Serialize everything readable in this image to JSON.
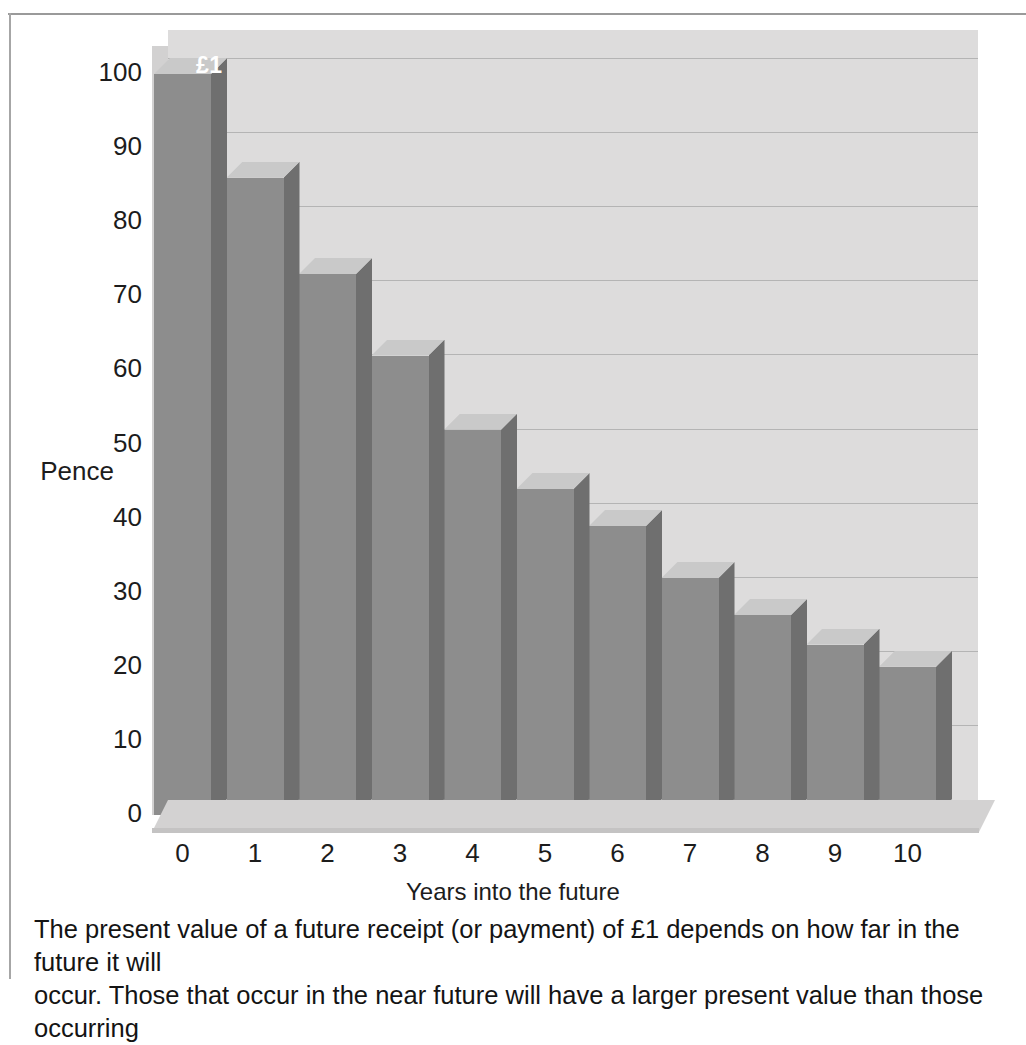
{
  "figure": {
    "bar_value_label": "£1",
    "caption_line_1": "The present value of a future receipt (or payment) of £1 depends on how far in the future it will",
    "caption_line_2": "occur. Those that occur in the near future will have a larger present value than those occurring"
  },
  "colors": {
    "bar_face": "#8d8d8d",
    "bar_side": "#6f6f6f",
    "bar_top": "#c9c9c9",
    "plot_background": "#dddcdc",
    "gridline": "#b4b4b4",
    "floor": "#d3d2d2",
    "text": "#1c1c1c"
  },
  "chart_data": {
    "type": "bar",
    "title": "",
    "subtitle": "",
    "xlabel": "Years into the future",
    "ylabel": "Pence",
    "categories": [
      "0",
      "1",
      "2",
      "3",
      "4",
      "5",
      "6",
      "7",
      "8",
      "9",
      "10"
    ],
    "values": [
      100,
      86,
      73,
      62,
      52,
      44,
      39,
      32,
      27,
      23,
      20
    ],
    "data_labels": [
      "£1",
      "",
      "",
      "",
      "",
      "",
      "",
      "",
      "",
      "",
      ""
    ],
    "ylim": [
      0,
      100
    ],
    "yticks": [
      0,
      10,
      20,
      30,
      40,
      50,
      60,
      70,
      80,
      90,
      100
    ],
    "ytick_labels": [
      "0",
      "10",
      "20",
      "30",
      "40",
      "50",
      "60",
      "70",
      "80",
      "90",
      "100"
    ],
    "xtick_labels": [
      "0",
      "1",
      "2",
      "3",
      "4",
      "5",
      "6",
      "7",
      "8",
      "9",
      "10"
    ],
    "grid": true,
    "grid_axis": "y",
    "legend": false,
    "legend_position": "none",
    "three_d": true,
    "series": [
      {
        "name": "Present value of £1",
        "values": [
          100,
          86,
          73,
          62,
          52,
          44,
          39,
          32,
          27,
          23,
          20
        ]
      }
    ]
  }
}
